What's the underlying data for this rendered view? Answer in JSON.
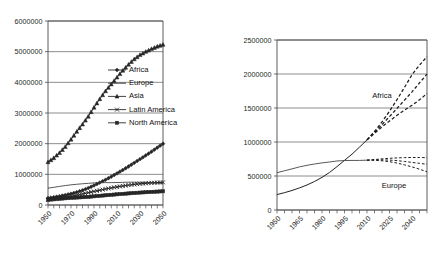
{
  "figure": {
    "background": "#ffffff",
    "ink": "#1a1a1a"
  },
  "chart_data": [
    {
      "id": "world-population-by-region",
      "type": "line",
      "title": "",
      "subtitle": "",
      "xlabel": "",
      "ylabel": "",
      "grid": true,
      "legend_position": "inside-right",
      "xlim": [
        1950,
        2050
      ],
      "ylim": [
        0,
        6000000
      ],
      "ytick_labels": [
        "0",
        "1000000",
        "2000000",
        "3000000",
        "4000000",
        "5000000",
        "6000000"
      ],
      "ytick_values": [
        0,
        1000000,
        2000000,
        3000000,
        4000000,
        5000000,
        6000000
      ],
      "xtick_labels": [
        "1950",
        "1970",
        "1990",
        "2010",
        "2030",
        "2050"
      ],
      "xtick_values": [
        1950,
        1970,
        1990,
        2010,
        2030,
        2050
      ],
      "xminor_step": 5,
      "x": [
        1950,
        1955,
        1960,
        1965,
        1970,
        1975,
        1980,
        1985,
        1990,
        1995,
        2000,
        2005,
        2010,
        2015,
        2020,
        2025,
        2030,
        2035,
        2040,
        2045,
        2050
      ],
      "series": [
        {
          "name": "Africa",
          "marker": "diamond",
          "values": [
            227000,
            255000,
            287000,
            325000,
            368000,
            419000,
            480000,
            552000,
            638000,
            730000,
            821000,
            925000,
            1031000,
            1141000,
            1256000,
            1374000,
            1494000,
            1615000,
            1738000,
            1870000,
            1998000
          ]
        },
        {
          "name": "Europe",
          "marker": "none",
          "values": [
            549000,
            577000,
            605000,
            634000,
            657000,
            676000,
            693000,
            706000,
            721000,
            727000,
            729000,
            729000,
            733000,
            739000,
            744000,
            745000,
            741000,
            735000,
            727000,
            718000,
            709000
          ]
        },
        {
          "name": "Asia",
          "marker": "triangle",
          "values": [
            1402000,
            1534000,
            1701000,
            1899000,
            2138000,
            2394000,
            2632000,
            2887000,
            3181000,
            3457000,
            3714000,
            3938000,
            4164000,
            4385000,
            4582000,
            4756000,
            4894000,
            5000000,
            5090000,
            5170000,
            5230000
          ]
        },
        {
          "name": "Latin America",
          "marker": "cross",
          "values": [
            167000,
            191000,
            220000,
            253000,
            287000,
            322000,
            361000,
            401000,
            442000,
            482000,
            521000,
            557000,
            590000,
            621000,
            648000,
            672000,
            692000,
            708000,
            721000,
            731000,
            738000
          ]
        },
        {
          "name": "North America",
          "marker": "square",
          "values": [
            172000,
            187000,
            204000,
            219000,
            231000,
            243000,
            254000,
            265000,
            283000,
            300000,
            316000,
            332000,
            348000,
            363000,
            378000,
            392000,
            405000,
            416000,
            427000,
            437000,
            448000
          ]
        }
      ]
    },
    {
      "id": "africa-europe-projection-variants",
      "type": "line",
      "title": "",
      "subtitle": "",
      "xlabel": "",
      "ylabel": "",
      "grid": true,
      "legend_position": "inline-annotation",
      "xlim": [
        1950,
        2050
      ],
      "ylim": [
        0,
        2500000
      ],
      "ytick_labels": [
        "0",
        "500000",
        "1000000",
        "1500000",
        "2000000",
        "2500000"
      ],
      "ytick_values": [
        0,
        500000,
        1000000,
        1500000,
        2000000,
        2500000
      ],
      "xtick_labels": [
        "1950",
        "1965",
        "1980",
        "1995",
        "2010",
        "2025",
        "2040"
      ],
      "xtick_values": [
        1950,
        1965,
        1980,
        1995,
        2010,
        2025,
        2040
      ],
      "xminor_step": 5,
      "annotations": [
        {
          "text": "Africa",
          "x": 2020,
          "y": 1650000
        },
        {
          "text": "Europe",
          "x": 2028,
          "y": 330000
        }
      ],
      "x_history": [
        1950,
        1955,
        1960,
        1965,
        1970,
        1975,
        1980,
        1985,
        1990,
        1995,
        2000,
        2005,
        2010
      ],
      "x_projection": [
        2010,
        2015,
        2020,
        2025,
        2030,
        2035,
        2040,
        2045,
        2050
      ],
      "series": [
        {
          "name": "Africa historical",
          "style": "solid",
          "values": [
            227000,
            255000,
            287000,
            325000,
            368000,
            419000,
            480000,
            552000,
            638000,
            730000,
            821000,
            925000,
            1031000
          ]
        },
        {
          "name": "Africa high variant",
          "style": "dashed",
          "values": [
            1031000,
            1155000,
            1296000,
            1452000,
            1623000,
            1803000,
            1990000,
            2130000,
            2255000
          ]
        },
        {
          "name": "Africa medium variant",
          "style": "dashed",
          "values": [
            1031000,
            1141000,
            1256000,
            1374000,
            1494000,
            1615000,
            1738000,
            1870000,
            1998000
          ]
        },
        {
          "name": "Africa low variant",
          "style": "dashed",
          "values": [
            1031000,
            1128000,
            1222000,
            1310000,
            1392000,
            1468000,
            1540000,
            1620000,
            1713000
          ]
        },
        {
          "name": "Europe historical",
          "style": "solid",
          "values": [
            549000,
            577000,
            605000,
            634000,
            657000,
            676000,
            693000,
            706000,
            721000,
            727000,
            729000,
            729000,
            733000
          ]
        },
        {
          "name": "Europe high variant",
          "style": "dashed",
          "values": [
            733000,
            742000,
            752000,
            760000,
            766000,
            770000,
            772000,
            772000,
            770000
          ]
        },
        {
          "name": "Europe medium variant",
          "style": "dashed",
          "values": [
            733000,
            737000,
            738000,
            734000,
            726000,
            714000,
            700000,
            686000,
            672000
          ]
        },
        {
          "name": "Europe low variant",
          "style": "dashed",
          "values": [
            733000,
            731000,
            724000,
            710000,
            690000,
            664000,
            634000,
            600000,
            562000
          ]
        }
      ]
    }
  ]
}
